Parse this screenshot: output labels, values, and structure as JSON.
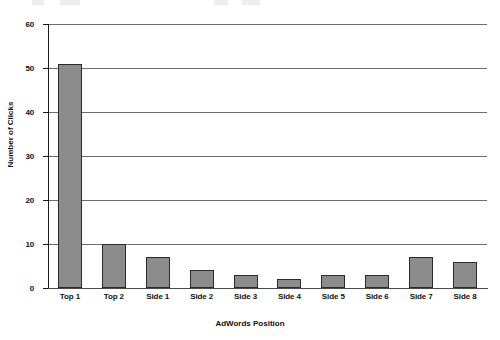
{
  "chart_data": {
    "type": "bar",
    "title": "",
    "xlabel": "AdWords Position",
    "ylabel": "Number of Clicks",
    "categories": [
      "Top 1",
      "Top 2",
      "Side 1",
      "Side 2",
      "Side 3",
      "Side 4",
      "Side 5",
      "Side 6",
      "Side 7",
      "Side 8"
    ],
    "values": [
      51,
      10,
      7,
      4,
      3,
      2,
      3,
      3,
      7,
      6
    ],
    "ylim": [
      0,
      60
    ],
    "ytick_labels": [
      "0",
      "10",
      "20",
      "30",
      "40",
      "50",
      "60"
    ],
    "ytick_values": [
      0,
      10,
      20,
      30,
      40,
      50,
      60
    ],
    "grid": "horizontal",
    "legend": "none",
    "bar_color": "#8c8c8c",
    "bar_border_color": "#2b2b2b",
    "gridline_color": "#6e6e6e",
    "axis_color": "#1a1a1a",
    "background": "#ffffff"
  }
}
